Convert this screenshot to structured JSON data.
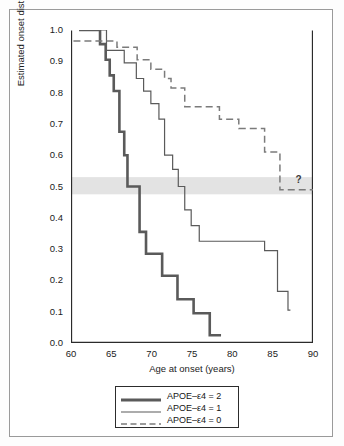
{
  "chart_data": {
    "type": "line",
    "title": "",
    "xlabel": "Age at onset (years)",
    "ylabel": "Estimated onset distribution",
    "xlim": [
      60,
      90
    ],
    "ylim": [
      0.0,
      1.0
    ],
    "xticks": [
      60,
      65,
      70,
      75,
      80,
      85,
      90
    ],
    "xticklabels": [
      "60",
      "65",
      "70",
      "75",
      "80",
      "85",
      "90"
    ],
    "yticks": [
      0.0,
      0.1,
      0.2,
      0.3,
      0.4,
      0.5,
      0.6,
      0.7,
      0.8,
      0.9,
      1.0
    ],
    "yticklabels": [
      "0.0",
      "0.1",
      "0.2",
      "0.3",
      "0.4",
      "0.5",
      "0.6",
      "0.7",
      "0.8",
      "0.9",
      "1.0"
    ],
    "grid": false,
    "legend_position": "below-axes",
    "annotations": [
      {
        "text": "?",
        "x": 88.2,
        "y": 0.505,
        "name": "unknown-median-marker"
      }
    ],
    "highlight_band": {
      "name": "median-band",
      "y_from": 0.475,
      "y_to": 0.53,
      "color": "#e3e3e3"
    },
    "series": [
      {
        "name": "APOE–ε4 = 2",
        "style": "thick-solid",
        "color": "#5a5a5a",
        "linewidth": 2.6,
        "points": [
          [
            61.0,
            1.0
          ],
          [
            63.6,
            1.0
          ],
          [
            63.6,
            0.955
          ],
          [
            64.3,
            0.955
          ],
          [
            64.3,
            0.905
          ],
          [
            64.8,
            0.905
          ],
          [
            64.8,
            0.855
          ],
          [
            65.3,
            0.855
          ],
          [
            65.3,
            0.805
          ],
          [
            66.0,
            0.805
          ],
          [
            66.0,
            0.675
          ],
          [
            66.6,
            0.675
          ],
          [
            66.6,
            0.6
          ],
          [
            67.0,
            0.6
          ],
          [
            67.0,
            0.5
          ],
          [
            68.5,
            0.5
          ],
          [
            68.5,
            0.355
          ],
          [
            69.3,
            0.355
          ],
          [
            69.3,
            0.285
          ],
          [
            71.3,
            0.285
          ],
          [
            71.3,
            0.215
          ],
          [
            73.2,
            0.215
          ],
          [
            73.2,
            0.14
          ],
          [
            75.2,
            0.14
          ],
          [
            75.2,
            0.095
          ],
          [
            77.2,
            0.095
          ],
          [
            77.2,
            0.025
          ],
          [
            78.6,
            0.025
          ]
        ]
      },
      {
        "name": "APOE–ε4 = 1",
        "style": "thin-solid",
        "color": "#5a5a5a",
        "linewidth": 1.2,
        "points": [
          [
            61.0,
            1.0
          ],
          [
            64.4,
            1.0
          ],
          [
            64.4,
            0.935
          ],
          [
            66.6,
            0.935
          ],
          [
            66.6,
            0.895
          ],
          [
            68.1,
            0.895
          ],
          [
            68.1,
            0.845
          ],
          [
            69.0,
            0.845
          ],
          [
            69.0,
            0.805
          ],
          [
            69.9,
            0.805
          ],
          [
            69.9,
            0.765
          ],
          [
            70.9,
            0.765
          ],
          [
            70.9,
            0.715
          ],
          [
            71.6,
            0.715
          ],
          [
            71.6,
            0.6
          ],
          [
            72.6,
            0.6
          ],
          [
            72.6,
            0.555
          ],
          [
            73.3,
            0.555
          ],
          [
            73.3,
            0.5
          ],
          [
            74.1,
            0.5
          ],
          [
            74.1,
            0.425
          ],
          [
            74.9,
            0.425
          ],
          [
            74.9,
            0.375
          ],
          [
            75.9,
            0.375
          ],
          [
            75.9,
            0.325
          ],
          [
            84.0,
            0.325
          ],
          [
            84.0,
            0.295
          ],
          [
            85.6,
            0.295
          ],
          [
            85.6,
            0.165
          ],
          [
            86.9,
            0.165
          ],
          [
            86.9,
            0.105
          ],
          [
            87.2,
            0.105
          ]
        ]
      },
      {
        "name": "APOE–ε4 = 0",
        "style": "dashed",
        "color": "#7b7b7b",
        "linewidth": 1.5,
        "points": [
          [
            60.3,
            0.965
          ],
          [
            65.7,
            0.965
          ],
          [
            65.7,
            0.945
          ],
          [
            68.2,
            0.945
          ],
          [
            68.2,
            0.905
          ],
          [
            69.9,
            0.905
          ],
          [
            69.9,
            0.875
          ],
          [
            71.6,
            0.875
          ],
          [
            71.6,
            0.845
          ],
          [
            72.4,
            0.845
          ],
          [
            72.4,
            0.815
          ],
          [
            74.1,
            0.815
          ],
          [
            74.1,
            0.755
          ],
          [
            78.4,
            0.755
          ],
          [
            78.4,
            0.715
          ],
          [
            80.8,
            0.715
          ],
          [
            80.8,
            0.685
          ],
          [
            84.0,
            0.685
          ],
          [
            84.0,
            0.61
          ],
          [
            85.9,
            0.61
          ],
          [
            85.9,
            0.49
          ],
          [
            90.0,
            0.49
          ]
        ]
      }
    ]
  },
  "legend": {
    "items": [
      {
        "label": "APOE–ε4 = 2",
        "style": "thick-solid"
      },
      {
        "label": "APOE–ε4 = 1",
        "style": "thin-solid"
      },
      {
        "label": "APOE–ε4 = 0",
        "style": "dashed"
      }
    ]
  }
}
